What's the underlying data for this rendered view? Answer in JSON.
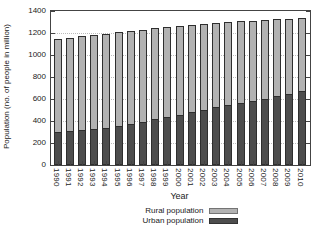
{
  "chart_data": {
    "type": "bar",
    "stacked": true,
    "title": "",
    "xlabel": "Year",
    "ylabel": "Population (no. of people in million)",
    "categories": [
      "1990",
      "1991",
      "1992",
      "1993",
      "1994",
      "1995",
      "1996",
      "1997",
      "1998",
      "1999",
      "2000",
      "2001",
      "2002",
      "2003",
      "2004",
      "2005",
      "2006",
      "2007",
      "2008",
      "2009",
      "2010"
    ],
    "series": [
      {
        "name": "Rural population",
        "color": "#b2b2b2",
        "values": [
          845,
          848,
          850,
          852,
          853,
          853,
          846,
          837,
          828,
          817,
          805,
          792,
          779,
          766,
          755,
          743,
          729,
          715,
          701,
          687,
          670
        ]
      },
      {
        "name": "Urban population",
        "color": "#4d4d4d",
        "values": [
          300,
          310,
          320,
          330,
          341,
          352,
          373,
          394,
          415,
          437,
          459,
          481,
          502,
          523,
          542,
          562,
          583,
          604,
          624,
          645,
          670
        ]
      }
    ],
    "stack_order_bottom_to_top": [
      "Urban population",
      "Rural population"
    ],
    "ylim": [
      0,
      1400
    ],
    "yticks": [
      0,
      200,
      400,
      600,
      800,
      1000,
      1200,
      1400
    ],
    "grid": true,
    "legend_position": "bottom-center",
    "bar_border_color": "#2e2e2e",
    "axis_color": "#444444"
  }
}
